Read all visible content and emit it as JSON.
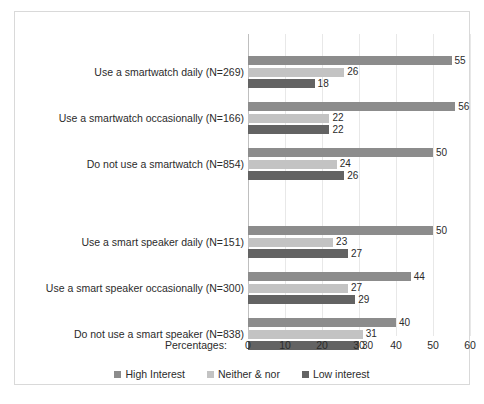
{
  "chart_data": {
    "type": "bar",
    "orientation": "horizontal",
    "title": "",
    "xlabel": "Percentages:",
    "ylabel": "",
    "xlim": [
      0,
      60
    ],
    "xticks": [
      0,
      10,
      20,
      30,
      40,
      50,
      60
    ],
    "grid": true,
    "legend_position": "bottom",
    "categories": [
      "Use a smartwatch daily (N=269)",
      "Use a smartwatch occasionally (N=166)",
      "Do not use a smartwatch (N=854)",
      "Use a smart speaker daily (N=151)",
      "Use a smart speaker occasionally (N=300)",
      "Do not use a smart speaker (N=838)"
    ],
    "series": [
      {
        "name": "High Interest",
        "color": "#8c8c8c",
        "values": [
          55,
          56,
          50,
          50,
          44,
          40
        ]
      },
      {
        "name": "Neither & nor",
        "color": "#c3c3c3",
        "values": [
          26,
          22,
          24,
          23,
          27,
          31
        ]
      },
      {
        "name": "Low interest",
        "color": "#636363",
        "values": [
          18,
          22,
          26,
          27,
          29,
          30
        ]
      }
    ]
  },
  "caption": ""
}
